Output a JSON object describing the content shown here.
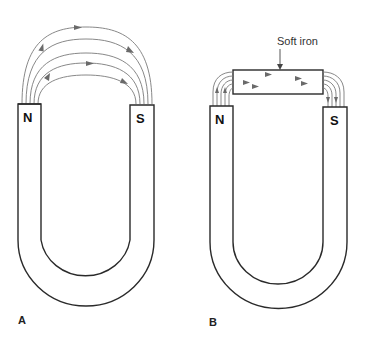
{
  "figure": {
    "panels": [
      {
        "id": "A",
        "label": "A",
        "poles": {
          "north": "N",
          "south": "S"
        },
        "description": "Horseshoe magnet with magnetic field lines arcing from N to S through air"
      },
      {
        "id": "B",
        "label": "B",
        "poles": {
          "north": "N",
          "south": "S"
        },
        "callout": "Soft iron",
        "description": "Horseshoe magnet with soft iron bar across poles concentrating field lines"
      }
    ]
  },
  "colors": {
    "outline": "#2a2a2a",
    "field_lines": "#7a7a7a",
    "background": "#ffffff"
  }
}
